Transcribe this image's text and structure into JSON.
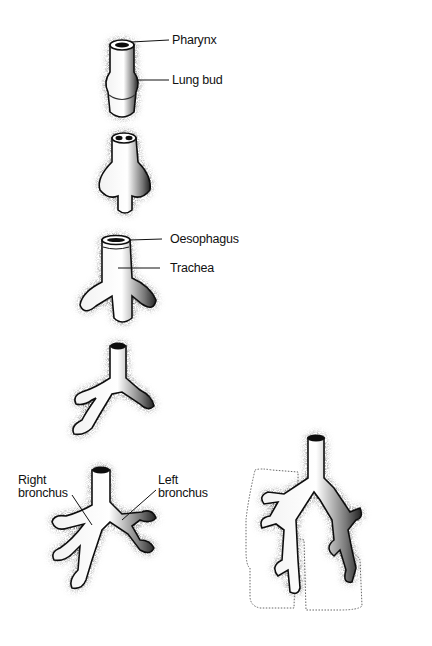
{
  "figure": {
    "stages": [
      {
        "id": "stage-1",
        "labels": [
          "Pharynx",
          "Lung bud"
        ]
      },
      {
        "id": "stage-2",
        "labels": []
      },
      {
        "id": "stage-3",
        "labels": [
          "Oesophagus",
          "Trachea"
        ]
      },
      {
        "id": "stage-4",
        "labels": []
      },
      {
        "id": "stage-5",
        "labels": [
          "Right bronchus",
          "Left bronchus"
        ]
      },
      {
        "id": "stage-6",
        "labels": []
      }
    ],
    "labels": {
      "pharynx": "Pharynx",
      "lung_bud": "Lung bud",
      "oesophagus": "Oesophagus",
      "trachea": "Trachea",
      "right_bronchus_line1": "Right",
      "right_bronchus_line2": "bronchus",
      "left_bronchus_line1": "Left",
      "left_bronchus_line2": "bronchus"
    },
    "colors": {
      "ink": "#111111",
      "background": "#ffffff",
      "outline_dotted": "#555555"
    }
  }
}
